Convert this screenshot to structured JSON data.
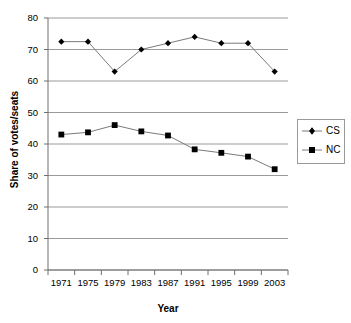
{
  "chart_data": {
    "type": "line",
    "title": "",
    "xlabel": "Year",
    "ylabel": "Share of votes/seats",
    "categories": [
      "1971",
      "1975",
      "1979",
      "1983",
      "1987",
      "1991",
      "1995",
      "1999",
      "2003"
    ],
    "ylim": [
      0,
      80
    ],
    "ytick_step": 10,
    "yticks": [
      0,
      10,
      20,
      30,
      40,
      50,
      60,
      70,
      80
    ],
    "ytick_labels": [
      "0",
      "10",
      "20",
      "30",
      "40",
      "50",
      "60",
      "70",
      "80"
    ],
    "grid": "horizontal",
    "legend_position": "right",
    "series": [
      {
        "name": "CS",
        "marker": "diamond",
        "color": "#000000",
        "values": [
          72.5,
          72.5,
          63,
          70,
          72,
          74,
          72,
          72,
          63
        ]
      },
      {
        "name": "NC",
        "marker": "square",
        "color": "#000000",
        "values": [
          43,
          43.7,
          46,
          44,
          42.7,
          38.3,
          37.2,
          36,
          32
        ]
      }
    ]
  },
  "legend": {
    "items": [
      {
        "label": "CS",
        "marker": "diamond"
      },
      {
        "label": "NC",
        "marker": "square"
      }
    ]
  },
  "colors": {
    "gridline": "#9a9a9a",
    "axis": "#6f6f6f",
    "series_line": "#7a7a7a",
    "marker": "#000000",
    "background": "#ffffff"
  }
}
